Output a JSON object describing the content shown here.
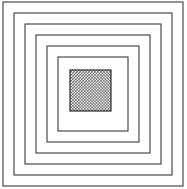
{
  "figure": {
    "width": 187,
    "height": 189,
    "background_color": "#ffffff",
    "line_color": "#3a3a3a",
    "hatch_color": "#2b2b2b",
    "hatch_background": "#ffffff",
    "hatch_spacing": 2,
    "hatch_stroke_width": 0.9
  },
  "chart_data": {
    "type": "diagram",
    "xlabel": "",
    "ylabel": "",
    "xlim": [
      0,
      187
    ],
    "ylim": [
      0,
      189
    ],
    "grid": false,
    "legend": "none",
    "shape_count": 6,
    "shapes": [
      {
        "name": "square-1-outer",
        "type": "rect",
        "x": 3,
        "y": 2,
        "width": 180,
        "height": 184,
        "fill": "none",
        "stroke": "#3a3a3a",
        "stroke_width": 1.1
      },
      {
        "name": "square-2",
        "type": "rect",
        "x": 14,
        "y": 13,
        "width": 158,
        "height": 162,
        "fill": "none",
        "stroke": "#3a3a3a",
        "stroke_width": 1.1
      },
      {
        "name": "square-3",
        "type": "rect",
        "x": 25,
        "y": 24,
        "width": 136,
        "height": 140,
        "fill": "none",
        "stroke": "#3a3a3a",
        "stroke_width": 1.1
      },
      {
        "name": "square-4",
        "type": "rect",
        "x": 36,
        "y": 35,
        "width": 114,
        "height": 118,
        "fill": "none",
        "stroke": "#3a3a3a",
        "stroke_width": 1.1
      },
      {
        "name": "square-5",
        "type": "rect",
        "x": 47,
        "y": 46,
        "width": 92,
        "height": 96,
        "fill": "none",
        "stroke": "#3a3a3a",
        "stroke_width": 1.1
      },
      {
        "name": "square-6-inner",
        "type": "rect",
        "x": 58,
        "y": 57,
        "width": 70,
        "height": 74,
        "fill": "none",
        "stroke": "#3a3a3a",
        "stroke_width": 1.1
      },
      {
        "name": "hatched-center-square",
        "type": "rect",
        "x": 70,
        "y": 70,
        "width": 41,
        "height": 41,
        "fill": "crosshatch",
        "stroke": "#2b2b2b",
        "stroke_width": 1.2
      }
    ]
  }
}
